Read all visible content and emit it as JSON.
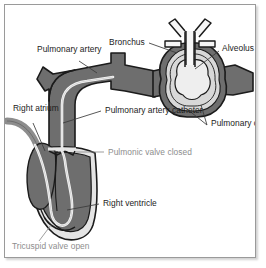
{
  "figure": {
    "background_color": "#ffffff",
    "frame_border_color": "#9a9a9a",
    "label_color": "#1b1b1b",
    "muted_label_color": "#8d8d8d",
    "vessel_fill_color": "#6e6e6e",
    "vessel_outline_color": "#1b1b1b",
    "lumen_color": "#d8d8d8",
    "alveolus_fill_color": "#e8e8e8",
    "catheter_color": "#f2f2f2"
  },
  "labels": [
    {
      "id": "pulmonary-artery",
      "lines": [
        "Pulmonary",
        "artery"
      ],
      "text": "Pulmonary artery",
      "color": "#1b1b1b",
      "x": 32,
      "y": 40
    },
    {
      "id": "bronchus",
      "lines": [
        "Bronchus"
      ],
      "text": "Bronchus",
      "color": "#1b1b1b",
      "x": 104,
      "y": 33
    },
    {
      "id": "alveolus",
      "lines": [
        "Alveolus"
      ],
      "text": "Alveolus",
      "color": "#1b1b1b",
      "x": 217,
      "y": 39
    },
    {
      "id": "right-atrium",
      "lines": [
        "Right",
        "atrium"
      ],
      "text": "Right atrium",
      "color": "#1b1b1b",
      "x": 8,
      "y": 99
    },
    {
      "id": "pulmonary-artery-catheter",
      "lines": [
        "Pulmonary",
        "artery",
        "catheter"
      ],
      "text": "Pulmonary artery catheter",
      "color": "#1b1b1b",
      "x": 100,
      "y": 101
    },
    {
      "id": "pulmonary-circulation",
      "lines": [
        "Pulmonary",
        "circulation"
      ],
      "text": "Pulmonary circulation",
      "color": "#1b1b1b",
      "x": 206,
      "y": 114
    },
    {
      "id": "pulmonic-valve-closed",
      "lines": [
        "Pulmonic",
        "valve",
        "closed"
      ],
      "text": "Pulmonic valve closed",
      "color": "#8d8d8d",
      "x": 103,
      "y": 143
    },
    {
      "id": "right-ventricle",
      "lines": [
        "Right",
        "ventricle"
      ],
      "text": "Right ventricle",
      "color": "#1b1b1b",
      "x": 98,
      "y": 194
    },
    {
      "id": "tricuspid-valve-open",
      "lines": [
        "Tricuspid",
        "valve open"
      ],
      "text": "Tricuspid valve open",
      "color": "#8d8d8d",
      "x": 7,
      "y": 237
    }
  ],
  "anatomy": [
    {
      "id": "pulmonary-artery-trunk",
      "name": "pulmonary artery"
    },
    {
      "id": "pulmonary-artery-branch",
      "name": "pulmonary artery branch"
    },
    {
      "id": "right-atrium-chamber",
      "name": "right atrium"
    },
    {
      "id": "right-ventricle-chamber",
      "name": "right ventricle"
    },
    {
      "id": "vena-cava",
      "name": "vena cava"
    },
    {
      "id": "catheter-line",
      "name": "pulmonary artery catheter"
    },
    {
      "id": "pulmonic-valve",
      "name": "pulmonic valve (closed)"
    },
    {
      "id": "tricuspid-valve",
      "name": "tricuspid valve (open)"
    },
    {
      "id": "bronchus-tube",
      "name": "bronchus"
    },
    {
      "id": "alveolus-sac",
      "name": "alveolus"
    },
    {
      "id": "capillary-rings",
      "name": "pulmonary circulation capillaries"
    }
  ]
}
